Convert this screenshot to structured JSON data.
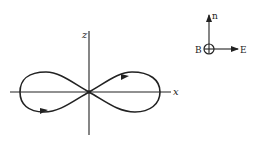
{
  "diagram": {
    "type": "figure-eight trajectory",
    "axes": {
      "vertical_label": "z",
      "horizontal_label": "x"
    },
    "inset": {
      "up_vector_label": "n",
      "center_label": "B",
      "center_symbol": "into-page (⊕)",
      "right_vector_label": "E"
    },
    "colors": {
      "ink": "#222222",
      "background": "#ffffff"
    }
  }
}
